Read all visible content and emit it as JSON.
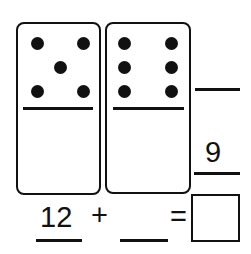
{
  "worksheet": {
    "dominoes": [
      {
        "top_pips": 5,
        "bottom_pips": 0
      },
      {
        "top_pips": 6,
        "bottom_pips": 0
      }
    ],
    "vertical_problem": {
      "top_blank": "",
      "addend": "9"
    },
    "equation": {
      "first_addend": "12",
      "operator": "+",
      "second_addend": "",
      "equals": "=",
      "answer": ""
    }
  }
}
